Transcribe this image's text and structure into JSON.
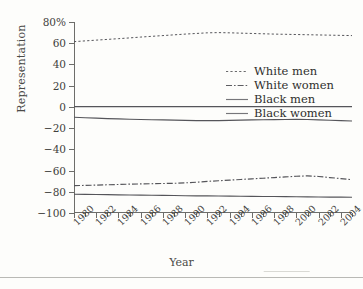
{
  "chart_data": {
    "type": "line",
    "title": "",
    "xlabel": "Year",
    "ylabel": "Representation",
    "xlim": [
      1980,
      2005
    ],
    "ylim": [
      -100,
      80
    ],
    "grid": false,
    "legend_position": "upper-center-right",
    "ytick_labels": [
      "80%",
      "60",
      "40",
      "20",
      "0",
      "−20",
      "−40",
      "−60",
      "−80",
      "−100"
    ],
    "ytick_values": [
      80,
      60,
      40,
      20,
      0,
      -20,
      -40,
      -60,
      -80,
      -100
    ],
    "xtick_labels": [
      "1980",
      "1982",
      "1984",
      "1986",
      "1988",
      "1990",
      "1992",
      "1994",
      "1996",
      "1998",
      "2000",
      "2002",
      "2004"
    ],
    "xtick_values": [
      1980,
      1982,
      1984,
      1986,
      1988,
      1990,
      1992,
      1994,
      1996,
      1998,
      2000,
      2002,
      2004
    ],
    "x": [
      1980,
      1981,
      1982,
      1983,
      1984,
      1985,
      1986,
      1987,
      1988,
      1989,
      1990,
      1991,
      1992,
      1993,
      1994,
      1995,
      1996,
      1997,
      1998,
      1999,
      2000,
      2001,
      2002,
      2003,
      2004,
      2005
    ],
    "series": [
      {
        "name": "White men",
        "style": "dotted",
        "values": [
          61.5,
          62.2,
          62.9,
          63.6,
          64.3,
          65.0,
          65.8,
          66.5,
          67.2,
          67.9,
          68.6,
          69.2,
          69.8,
          70.0,
          69.8,
          69.5,
          69.2,
          68.9,
          68.6,
          68.4,
          68.2,
          68.0,
          67.8,
          67.6,
          67.4,
          67.2
        ]
      },
      {
        "name": "White women",
        "style": "dash-dot",
        "values": [
          -74.2,
          -74.0,
          -73.7,
          -73.4,
          -73.1,
          -72.8,
          -72.6,
          -72.4,
          -72.2,
          -72.0,
          -71.6,
          -71.0,
          -70.2,
          -69.6,
          -69.0,
          -68.4,
          -67.8,
          -67.2,
          -66.6,
          -66.0,
          -65.4,
          -65.0,
          -65.6,
          -66.6,
          -67.6,
          -68.6
        ]
      },
      {
        "name": "Black men",
        "style": "solid",
        "values": [
          0.2,
          0.2,
          0.2,
          0.2,
          0.2,
          0.2,
          0.2,
          0.2,
          0.2,
          0.2,
          0.2,
          0.2,
          0.2,
          0.2,
          0.2,
          0.2,
          0.2,
          0.2,
          0.2,
          0.2,
          0.2,
          0.2,
          0.2,
          0.2,
          0.2,
          0.2
        ]
      },
      {
        "name": "Black women",
        "style": "solid",
        "values": [
          -9.8,
          -10.2,
          -10.6,
          -11.0,
          -11.3,
          -11.6,
          -11.9,
          -12.1,
          -12.3,
          -12.5,
          -12.7,
          -12.9,
          -13.0,
          -12.9,
          -12.7,
          -12.5,
          -12.3,
          -12.1,
          -12.0,
          -11.9,
          -11.8,
          -11.9,
          -12.2,
          -12.6,
          -13.0,
          -13.3
        ]
      },
      {
        "name": "Black women lower",
        "style": "solid",
        "values": [
          -82.3,
          -82.4,
          -82.6,
          -82.7,
          -82.9,
          -83.0,
          -83.2,
          -83.3,
          -83.4,
          -83.5,
          -83.7,
          -83.8,
          -83.9,
          -84.0,
          -84.1,
          -84.2,
          -84.3,
          -84.4,
          -84.5,
          -84.6,
          -84.7,
          -84.8,
          -84.9,
          -85.0,
          -85.1,
          -85.2
        ]
      }
    ],
    "legend_entries": [
      {
        "label": "White men",
        "style": "dotted"
      },
      {
        "label": "White women",
        "style": "dash-dot"
      },
      {
        "label": "Black men",
        "style": "solid"
      },
      {
        "label": "Black women",
        "style": "solid"
      }
    ]
  }
}
